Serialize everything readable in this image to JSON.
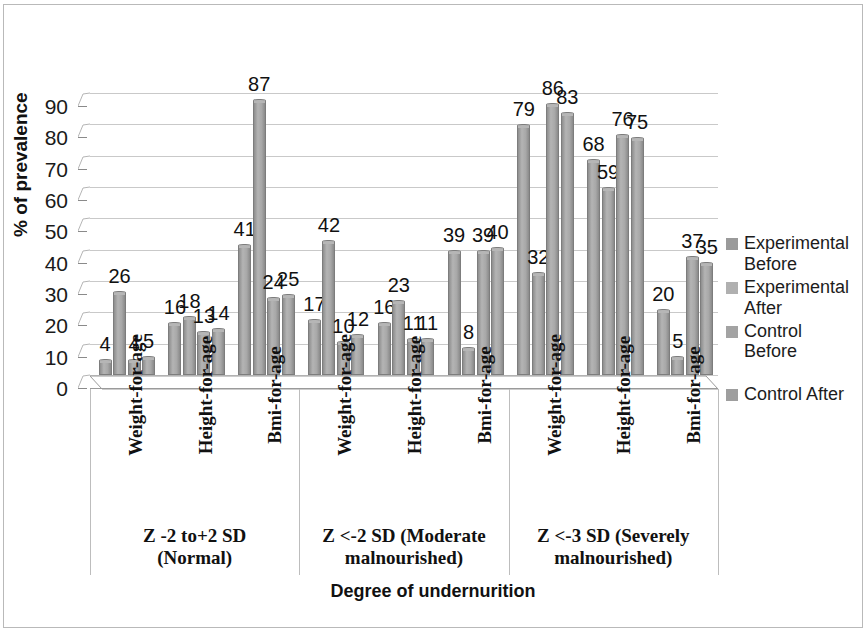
{
  "chart_data": {
    "type": "bar",
    "title": "",
    "xlabel": "Degree of undernurition",
    "ylabel": "% of prevalence",
    "ylim": [
      0,
      90
    ],
    "ytick_labels": [
      "0",
      "10",
      "20",
      "30",
      "40",
      "50",
      "60",
      "70",
      "80",
      "90"
    ],
    "grid": true,
    "legend_position": "right",
    "categories": [
      "Weight-for-age",
      "Height-for-age",
      "Bmi-for-age",
      "Weight-for-age",
      "Height-for-age",
      "Bmi-for-age",
      "Weight-for-age",
      "Height-for-age",
      "Bmi-for-age"
    ],
    "major_categories": [
      "Z -2 to+2 SD (Normal)",
      "Z <-2 SD (Moderate malnourished)",
      "Z <-3 SD (Severely malnourished)"
    ],
    "major_categories_lines": [
      [
        "Z -2 to+2 SD",
        "(Normal)"
      ],
      [
        "Z <-2 SD (Moderate",
        "malnourished)"
      ],
      [
        "Z <-3 SD (Severely",
        "malnourished)"
      ]
    ],
    "series": [
      {
        "name": "Experimental Before",
        "color": "#9a9a9a",
        "values": [
          4,
          16,
          41,
          17,
          16,
          39,
          79,
          68,
          20
        ]
      },
      {
        "name": "Experimental After",
        "color": "#b0b0b0",
        "values": [
          26,
          18,
          87,
          42,
          23,
          8,
          32,
          59,
          5
        ]
      },
      {
        "name": "Control Before",
        "color": "#a3a3a3",
        "values": [
          4,
          13,
          24,
          10,
          11,
          39,
          86,
          76,
          37
        ]
      },
      {
        "name": "Control After",
        "color": "#9e9e9e",
        "values": [
          5,
          14,
          25,
          12,
          11,
          40,
          83,
          75,
          35
        ]
      }
    ]
  },
  "legend": {
    "entries": [
      {
        "label_lines": [
          "Experimental",
          "Before"
        ]
      },
      {
        "label_lines": [
          "Experimental",
          "After"
        ]
      },
      {
        "label_lines": [
          "Control Before"
        ]
      },
      {
        "label_lines": [
          "Control After"
        ]
      }
    ]
  }
}
